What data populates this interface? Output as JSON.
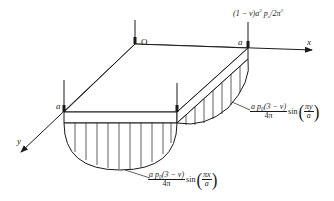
{
  "diagram": {
    "type": "plate-bending-reaction-diagram",
    "axes": {
      "x_label": "x",
      "y_label": "y"
    },
    "corners": {
      "origin_label": "O",
      "corner_x_label": "a",
      "corner_y_label": "a"
    },
    "corner_force_label": "(1 − ν)a²p₀/2π²",
    "corner_force_parts": {
      "prefix": "(1 − ν)a",
      "sup": "2",
      "mid": " p",
      "sub": "o",
      "suffix": "/2π",
      "sup2": "2"
    },
    "edge_reaction_y": {
      "numerator": "a p₀(3 − ν)",
      "denominator": "4π",
      "function": "sin",
      "argument_numerator": "πy",
      "argument_denominator": "a"
    },
    "edge_reaction_x": {
      "numerator": "a p₀(3 − ν)",
      "denominator": "4π",
      "function": "sin",
      "argument_numerator": "πx",
      "argument_denominator": "a"
    },
    "colors": {
      "ink": "#1a1a1a",
      "background": "#ffffff"
    }
  }
}
